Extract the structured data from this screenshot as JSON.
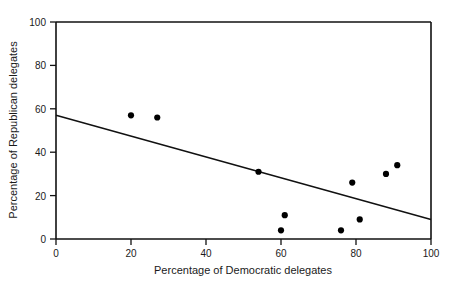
{
  "chart_data": {
    "type": "scatter",
    "title": "",
    "xlabel": "Percentage of Democratic delegates",
    "ylabel": "Percentage of Republican delegates",
    "xlim": [
      0,
      100
    ],
    "ylim": [
      0,
      100
    ],
    "xticks": [
      "0",
      "20",
      "40",
      "60",
      "80",
      "100"
    ],
    "xtick_values": [
      0,
      20,
      40,
      60,
      80,
      100
    ],
    "yticks": [
      "0",
      "20",
      "40",
      "60",
      "80",
      "100"
    ],
    "ytick_values": [
      0,
      20,
      40,
      60,
      80,
      100
    ],
    "grid": false,
    "legend": "none",
    "marker": "filled-circle",
    "marker_color": "#000000",
    "points": [
      {
        "x": 20,
        "y": 57
      },
      {
        "x": 27,
        "y": 56
      },
      {
        "x": 54,
        "y": 31
      },
      {
        "x": 60,
        "y": 4
      },
      {
        "x": 61,
        "y": 11
      },
      {
        "x": 76,
        "y": 4
      },
      {
        "x": 79,
        "y": 26
      },
      {
        "x": 81,
        "y": 9
      },
      {
        "x": 88,
        "y": 30
      },
      {
        "x": 91,
        "y": 34
      }
    ],
    "series": [
      {
        "name": "delegate-percentages",
        "x": [
          20,
          27,
          54,
          60,
          61,
          76,
          79,
          81,
          88,
          91
        ],
        "values": [
          57,
          56,
          31,
          4,
          11,
          4,
          26,
          9,
          30,
          34
        ]
      }
    ],
    "trend_line": {
      "type": "linear-fit",
      "color": "#111111",
      "x_start": 0,
      "y_start": 57,
      "x_end": 100,
      "y_end": 9
    }
  },
  "axes": {
    "x_title": "Percentage of Democratic delegates",
    "y_title": "Percentage of Republican delegates",
    "x_tick_labels": [
      "0",
      "20",
      "40",
      "60",
      "80",
      "100"
    ],
    "y_tick_labels": [
      "0",
      "20",
      "40",
      "60",
      "80",
      "100"
    ]
  }
}
